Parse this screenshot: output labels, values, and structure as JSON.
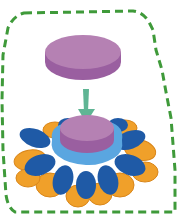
{
  "diagram": {
    "colors": {
      "boundary": "#3f9a3a",
      "disc_top": "#b581b3",
      "disc_side": "#9a5fa0",
      "arrow": "#5fb594",
      "petal_dark_blue": "#1f5aa6",
      "petal_orange": "#f0a02a",
      "petal_orange_dark": "#d9861a",
      "collar_light_blue": "#5aa6e0"
    },
    "elements": [
      {
        "id": "boundary",
        "type": "dashed-outline"
      },
      {
        "id": "ligand-disc",
        "type": "disc"
      },
      {
        "id": "arrow",
        "type": "arrow",
        "direction": "down"
      },
      {
        "id": "receptor-flower",
        "type": "flower",
        "petals": 16
      },
      {
        "id": "docked-disc",
        "type": "disc"
      }
    ]
  }
}
